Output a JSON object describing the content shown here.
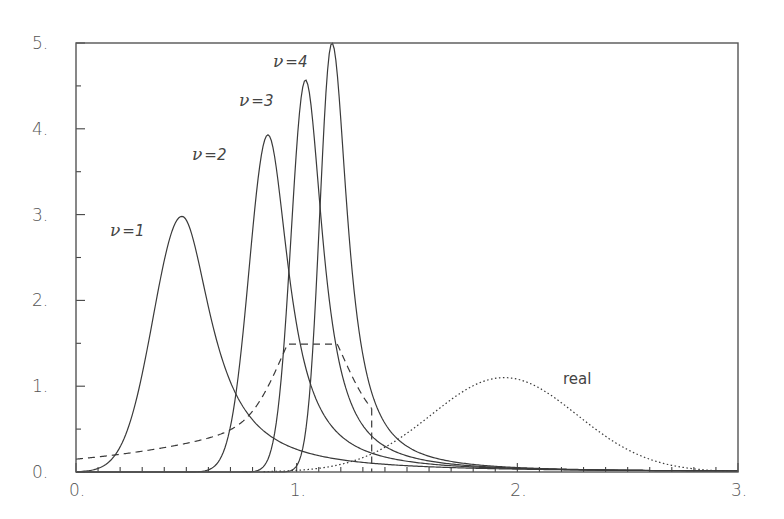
{
  "chart_data": {
    "type": "line",
    "title": "",
    "xlabel": "",
    "ylabel": "",
    "xlim": [
      0,
      3
    ],
    "ylim": [
      0,
      5
    ],
    "grid": false,
    "legend": "none (inline curve labels)",
    "x_ticks": {
      "major": [
        0,
        1,
        2,
        3
      ],
      "major_labels": [
        "0.",
        "1.",
        "2.",
        "3."
      ],
      "minor_step": 0.1
    },
    "y_ticks": {
      "major": [
        0,
        1,
        2,
        3,
        4,
        5
      ],
      "major_labels": [
        "0.",
        "1.",
        "2.",
        "3.",
        "4.",
        "5."
      ],
      "minor_step": 0.5
    },
    "series": [
      {
        "name": "ν=1",
        "label_nu": "ν",
        "label_rest": "=1",
        "style": "solid",
        "peak_x": 0.48,
        "peak_y": 2.98,
        "width_left": 0.13,
        "width_right": 0.17,
        "label_pos": [
          0.2,
          2.7
        ]
      },
      {
        "name": "ν=2",
        "label_nu": "ν",
        "label_rest": "=2",
        "style": "solid",
        "peak_x": 0.87,
        "peak_y": 3.93,
        "width_left": 0.085,
        "width_right": 0.12,
        "label_pos": [
          0.47,
          3.58
        ]
      },
      {
        "name": "ν=3",
        "label_nu": "ν",
        "label_rest": "=3",
        "style": "solid",
        "peak_x": 1.04,
        "peak_y": 4.57,
        "width_left": 0.065,
        "width_right": 0.1,
        "label_pos": [
          0.72,
          3.92
        ]
      },
      {
        "name": "ν=4",
        "label_nu": "ν",
        "label_rest": "=4",
        "style": "solid",
        "peak_x": 1.16,
        "peak_y": 5.0,
        "width_left": 0.055,
        "width_right": 0.09,
        "label_pos": [
          0.8,
          4.78
        ]
      },
      {
        "name": "dashed",
        "style": "dashed",
        "peak_x": 1.07,
        "peak_y": 1.49,
        "start_y": 0.15,
        "cutoff_x": 1.34
      },
      {
        "name": "real",
        "style": "dotted",
        "peak_x": 1.94,
        "peak_y": 1.1,
        "sigma": 0.33,
        "label": "real",
        "label_pos": [
          2.17,
          1.0
        ]
      }
    ]
  },
  "labels": {
    "nu1_greek": "ν",
    "nu1_rest": "=1",
    "nu2_greek": "ν",
    "nu2_rest": "=2",
    "nu3_greek": "ν",
    "nu3_rest": "=3",
    "nu4_greek": "ν",
    "nu4_rest": "=4",
    "real": "real"
  }
}
